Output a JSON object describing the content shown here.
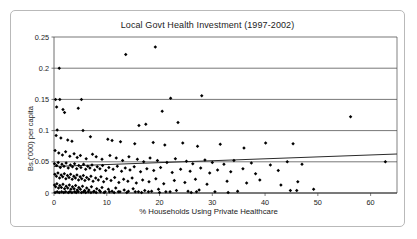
{
  "chart_data": {
    "type": "scatter",
    "title": "Local Govt Health Investment (1997-2002)",
    "xlabel": "% Households Using Private Healthcare",
    "ylabel": "Bs.('000) per capita",
    "xlim": [
      0,
      65
    ],
    "ylim": [
      0,
      0.25
    ],
    "xticks": [
      0,
      10,
      20,
      30,
      40,
      50,
      60
    ],
    "xtick_labels": [
      "0",
      "10",
      "20",
      "30",
      "40",
      "50",
      "60"
    ],
    "yticks": [
      0,
      0.05,
      0.1,
      0.15,
      0.2,
      0.25
    ],
    "ytick_labels": [
      "0",
      "0.05",
      "0.1",
      "0.15",
      "0.2",
      "0.25"
    ],
    "grid": "horizontal",
    "legend": "none",
    "marker": "diamond",
    "marker_color": "#000000",
    "trendline": {
      "visible": true,
      "color": "#2b2b2b",
      "x_start": 0,
      "y_start": 0.0425,
      "x_end": 65,
      "y_end": 0.0625
    },
    "points": [
      [
        1.0,
        0.2
      ],
      [
        13.6,
        0.222
      ],
      [
        19.2,
        0.234
      ],
      [
        0.3,
        0.15
      ],
      [
        1.1,
        0.15
      ],
      [
        5.2,
        0.15
      ],
      [
        22.1,
        0.152
      ],
      [
        28.0,
        0.156
      ],
      [
        0.5,
        0.138
      ],
      [
        1.7,
        0.134
      ],
      [
        2.0,
        0.129
      ],
      [
        4.6,
        0.136
      ],
      [
        20.5,
        0.131
      ],
      [
        0.6,
        0.101
      ],
      [
        5.5,
        0.1
      ],
      [
        16.1,
        0.108
      ],
      [
        17.4,
        0.11
      ],
      [
        23.5,
        0.113
      ],
      [
        56.2,
        0.122
      ],
      [
        0.4,
        0.092
      ],
      [
        1.3,
        0.088
      ],
      [
        2.6,
        0.085
      ],
      [
        3.4,
        0.083
      ],
      [
        6.9,
        0.09
      ],
      [
        10.2,
        0.086
      ],
      [
        11.0,
        0.084
      ],
      [
        12.6,
        0.082
      ],
      [
        15.3,
        0.079
      ],
      [
        18.8,
        0.081
      ],
      [
        21.0,
        0.077
      ],
      [
        24.4,
        0.08
      ],
      [
        27.2,
        0.075
      ],
      [
        31.5,
        0.078
      ],
      [
        36.0,
        0.072
      ],
      [
        40.1,
        0.08
      ],
      [
        45.3,
        0.079
      ],
      [
        0.2,
        0.068
      ],
      [
        0.9,
        0.064
      ],
      [
        1.6,
        0.061
      ],
      [
        2.2,
        0.066
      ],
      [
        3.0,
        0.059
      ],
      [
        3.8,
        0.063
      ],
      [
        4.4,
        0.057
      ],
      [
        5.0,
        0.06
      ],
      [
        6.1,
        0.055
      ],
      [
        7.3,
        0.062
      ],
      [
        8.0,
        0.058
      ],
      [
        9.1,
        0.054
      ],
      [
        10.6,
        0.06
      ],
      [
        11.8,
        0.056
      ],
      [
        13.0,
        0.052
      ],
      [
        14.2,
        0.058
      ],
      [
        15.8,
        0.054
      ],
      [
        17.0,
        0.05
      ],
      [
        18.2,
        0.056
      ],
      [
        19.6,
        0.052
      ],
      [
        21.4,
        0.049
      ],
      [
        23.0,
        0.055
      ],
      [
        25.1,
        0.051
      ],
      [
        26.3,
        0.047
      ],
      [
        28.6,
        0.053
      ],
      [
        30.0,
        0.049
      ],
      [
        32.2,
        0.046
      ],
      [
        34.1,
        0.052
      ],
      [
        37.4,
        0.048
      ],
      [
        41.0,
        0.045
      ],
      [
        44.2,
        0.05
      ],
      [
        47.0,
        0.046
      ],
      [
        62.8,
        0.05
      ],
      [
        0.1,
        0.047
      ],
      [
        0.5,
        0.044
      ],
      [
        0.8,
        0.049
      ],
      [
        1.2,
        0.041
      ],
      [
        1.5,
        0.046
      ],
      [
        1.9,
        0.043
      ],
      [
        2.3,
        0.048
      ],
      [
        2.7,
        0.04
      ],
      [
        3.1,
        0.045
      ],
      [
        3.5,
        0.042
      ],
      [
        3.9,
        0.047
      ],
      [
        4.3,
        0.039
      ],
      [
        4.7,
        0.044
      ],
      [
        5.1,
        0.041
      ],
      [
        5.6,
        0.046
      ],
      [
        6.0,
        0.038
      ],
      [
        6.4,
        0.043
      ],
      [
        6.8,
        0.04
      ],
      [
        7.2,
        0.045
      ],
      [
        7.7,
        0.037
      ],
      [
        8.2,
        0.042
      ],
      [
        8.7,
        0.039
      ],
      [
        9.2,
        0.044
      ],
      [
        9.8,
        0.036
      ],
      [
        10.4,
        0.041
      ],
      [
        11.2,
        0.038
      ],
      [
        12.0,
        0.043
      ],
      [
        12.8,
        0.035
      ],
      [
        13.5,
        0.04
      ],
      [
        14.4,
        0.037
      ],
      [
        15.2,
        0.042
      ],
      [
        16.4,
        0.034
      ],
      [
        17.6,
        0.039
      ],
      [
        18.9,
        0.036
      ],
      [
        20.2,
        0.041
      ],
      [
        22.4,
        0.033
      ],
      [
        24.0,
        0.038
      ],
      [
        25.8,
        0.035
      ],
      [
        27.8,
        0.04
      ],
      [
        29.5,
        0.032
      ],
      [
        31.0,
        0.037
      ],
      [
        33.5,
        0.034
      ],
      [
        35.8,
        0.039
      ],
      [
        38.2,
        0.031
      ],
      [
        42.5,
        0.036
      ],
      [
        0.15,
        0.03
      ],
      [
        0.45,
        0.027
      ],
      [
        0.75,
        0.032
      ],
      [
        1.05,
        0.024
      ],
      [
        1.35,
        0.029
      ],
      [
        1.65,
        0.026
      ],
      [
        1.95,
        0.031
      ],
      [
        2.25,
        0.023
      ],
      [
        2.55,
        0.028
      ],
      [
        2.85,
        0.025
      ],
      [
        3.15,
        0.03
      ],
      [
        3.45,
        0.022
      ],
      [
        3.75,
        0.027
      ],
      [
        4.05,
        0.024
      ],
      [
        4.35,
        0.029
      ],
      [
        4.65,
        0.021
      ],
      [
        4.95,
        0.026
      ],
      [
        5.25,
        0.023
      ],
      [
        5.55,
        0.028
      ],
      [
        5.85,
        0.02
      ],
      [
        6.2,
        0.025
      ],
      [
        6.6,
        0.022
      ],
      [
        7.0,
        0.027
      ],
      [
        7.4,
        0.019
      ],
      [
        7.9,
        0.024
      ],
      [
        8.4,
        0.021
      ],
      [
        8.9,
        0.026
      ],
      [
        9.4,
        0.018
      ],
      [
        10.0,
        0.023
      ],
      [
        10.8,
        0.02
      ],
      [
        11.5,
        0.025
      ],
      [
        12.3,
        0.017
      ],
      [
        13.2,
        0.022
      ],
      [
        14.0,
        0.019
      ],
      [
        14.8,
        0.024
      ],
      [
        15.6,
        0.016
      ],
      [
        16.8,
        0.021
      ],
      [
        18.0,
        0.018
      ],
      [
        19.3,
        0.023
      ],
      [
        20.8,
        0.015
      ],
      [
        22.8,
        0.02
      ],
      [
        24.8,
        0.017
      ],
      [
        26.8,
        0.022
      ],
      [
        29.0,
        0.014
      ],
      [
        32.8,
        0.019
      ],
      [
        36.5,
        0.016
      ],
      [
        39.0,
        0.021
      ],
      [
        43.0,
        0.013
      ],
      [
        46.2,
        0.018
      ],
      [
        0.1,
        0.013
      ],
      [
        0.3,
        0.01
      ],
      [
        0.55,
        0.015
      ],
      [
        0.85,
        0.008
      ],
      [
        1.1,
        0.012
      ],
      [
        1.4,
        0.009
      ],
      [
        1.7,
        0.014
      ],
      [
        2.0,
        0.007
      ],
      [
        2.3,
        0.011
      ],
      [
        2.6,
        0.008
      ],
      [
        2.9,
        0.013
      ],
      [
        3.2,
        0.006
      ],
      [
        3.5,
        0.01
      ],
      [
        3.8,
        0.007
      ],
      [
        4.1,
        0.012
      ],
      [
        4.4,
        0.005
      ],
      [
        4.7,
        0.009
      ],
      [
        5.0,
        0.006
      ],
      [
        5.4,
        0.011
      ],
      [
        5.8,
        0.004
      ],
      [
        6.2,
        0.008
      ],
      [
        6.6,
        0.005
      ],
      [
        7.1,
        0.01
      ],
      [
        7.6,
        0.003
      ],
      [
        8.1,
        0.007
      ],
      [
        8.6,
        0.004
      ],
      [
        9.1,
        0.009
      ],
      [
        9.7,
        0.002
      ],
      [
        10.3,
        0.006
      ],
      [
        11.0,
        0.003
      ],
      [
        11.7,
        0.008
      ],
      [
        12.5,
        0.002
      ],
      [
        13.3,
        0.005
      ],
      [
        14.1,
        0.003
      ],
      [
        15.0,
        0.007
      ],
      [
        16.0,
        0.002
      ],
      [
        17.2,
        0.004
      ],
      [
        18.5,
        0.003
      ],
      [
        19.8,
        0.006
      ],
      [
        21.2,
        0.002
      ],
      [
        23.2,
        0.004
      ],
      [
        25.4,
        0.003
      ],
      [
        27.5,
        0.005
      ],
      [
        30.5,
        0.002
      ],
      [
        34.8,
        0.003
      ],
      [
        44.8,
        0.004
      ],
      [
        46.0,
        0.004
      ],
      [
        49.2,
        0.006
      ],
      [
        0.2,
        0.001
      ],
      [
        0.6,
        0.002
      ],
      [
        1.0,
        0.001
      ],
      [
        1.45,
        0.002
      ],
      [
        1.85,
        0.001
      ],
      [
        2.2,
        0.002
      ],
      [
        2.7,
        0.001
      ],
      [
        3.0,
        0.002
      ],
      [
        3.4,
        0.001
      ],
      [
        3.9,
        0.002
      ],
      [
        4.2,
        0.001
      ],
      [
        4.6,
        0.002
      ],
      [
        5.2,
        0.001
      ],
      [
        5.6,
        0.002
      ],
      [
        6.0,
        0.001
      ],
      [
        6.5,
        0.002
      ],
      [
        7.0,
        0.001
      ],
      [
        7.5,
        0.002
      ],
      [
        8.0,
        0.001
      ],
      [
        8.8,
        0.002
      ],
      [
        9.5,
        0.001
      ],
      [
        10.5,
        0.002
      ],
      [
        11.4,
        0.001
      ],
      [
        12.2,
        0.002
      ],
      [
        13.8,
        0.001
      ],
      [
        15.4,
        0.002
      ],
      [
        16.6,
        0.001
      ],
      [
        17.9,
        0.002
      ],
      [
        20.0,
        0.001
      ],
      [
        22.0,
        0.002
      ],
      [
        26.0,
        0.001
      ],
      [
        27.0,
        0.002
      ],
      [
        33.0,
        0.001
      ]
    ]
  }
}
